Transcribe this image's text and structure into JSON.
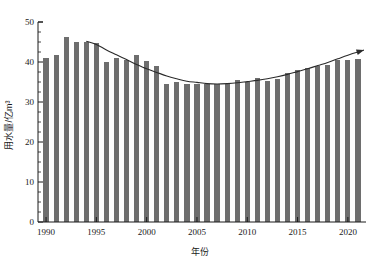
{
  "chart_data": {
    "type": "bar",
    "title": "",
    "subtitle": "",
    "xlabel": "年份",
    "ylabel": "用水量/亿m³",
    "xlim": [
      1989.2,
      2021.8
    ],
    "ylim": [
      0,
      50
    ],
    "grid": false,
    "legend": null,
    "bar_color": "#6e6e6e",
    "line_color": "#2b2b2b",
    "axis_color": "#1a1a1a",
    "ytick_labels": [
      "0",
      "10",
      "20",
      "30",
      "40",
      "50"
    ],
    "yticks": [
      0,
      10,
      20,
      30,
      40,
      50
    ],
    "ytick_minor_step": 2.5,
    "xtick_labels": [
      "1990",
      "1995",
      "2000",
      "2005",
      "2010",
      "2015",
      "2020"
    ],
    "xticks": [
      1990,
      1995,
      2000,
      2005,
      2010,
      2015,
      2020
    ],
    "categories": [
      "1990",
      "1991",
      "1992",
      "1993",
      "1994",
      "1995",
      "1996",
      "1997",
      "1998",
      "1999",
      "2000",
      "2001",
      "2002",
      "2003",
      "2004",
      "2005",
      "2006",
      "2007",
      "2008",
      "2009",
      "2010",
      "2011",
      "2012",
      "2013",
      "2014",
      "2015",
      "2016",
      "2017",
      "2018",
      "2019",
      "2020",
      "2021"
    ],
    "values": [
      41.0,
      41.8,
      46.3,
      45.0,
      45.0,
      44.7,
      40.0,
      40.9,
      40.5,
      41.7,
      40.2,
      38.9,
      34.6,
      34.9,
      34.5,
      34.5,
      34.4,
      34.4,
      34.5,
      35.5,
      34.9,
      35.9,
      35.2,
      35.8,
      37.3,
      37.9,
      38.5,
      38.9,
      39.3,
      40.6,
      40.5,
      40.8
    ],
    "annotations": [
      {
        "name": "trend-curve",
        "type": "polynomial-trend",
        "with_arrow": true,
        "x_start": 1994,
        "x_end": 2021.6,
        "points": [
          [
            1994.0,
            45.2
          ],
          [
            1995.0,
            44.4
          ],
          [
            1996.0,
            43.0
          ],
          [
            1997.0,
            41.8
          ],
          [
            1998.0,
            40.6
          ],
          [
            1999.0,
            39.4
          ],
          [
            2000.0,
            38.3
          ],
          [
            2001.0,
            37.4
          ],
          [
            2002.0,
            36.5
          ],
          [
            2003.0,
            35.8
          ],
          [
            2004.0,
            35.2
          ],
          [
            2005.0,
            34.9
          ],
          [
            2006.0,
            34.6
          ],
          [
            2007.0,
            34.5
          ],
          [
            2008.0,
            34.6
          ],
          [
            2009.0,
            34.8
          ],
          [
            2010.0,
            35.1
          ],
          [
            2011.0,
            35.4
          ],
          [
            2012.0,
            35.8
          ],
          [
            2013.0,
            36.3
          ],
          [
            2014.0,
            36.9
          ],
          [
            2015.0,
            37.6
          ],
          [
            2016.0,
            38.3
          ],
          [
            2017.0,
            39.1
          ],
          [
            2018.0,
            39.9
          ],
          [
            2019.0,
            40.8
          ],
          [
            2020.0,
            41.7
          ],
          [
            2021.6,
            43.0
          ]
        ]
      }
    ]
  }
}
